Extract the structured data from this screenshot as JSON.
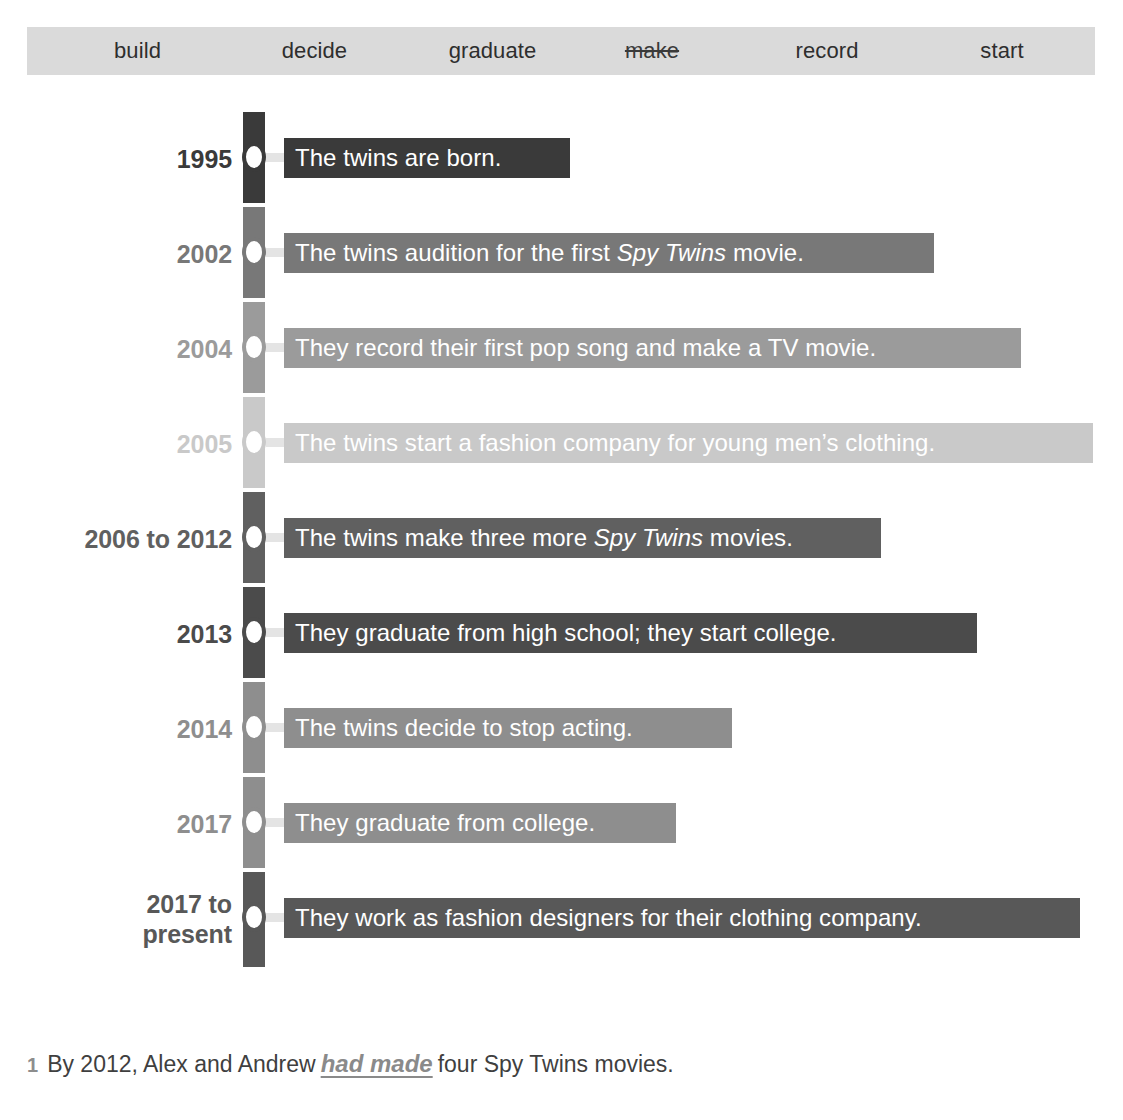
{
  "word_bank": {
    "name": "word-bank",
    "background_color": "#dadada",
    "words": [
      {
        "label": "build",
        "struck": false
      },
      {
        "label": "decide",
        "struck": false
      },
      {
        "label": "graduate",
        "struck": false
      },
      {
        "label": "make",
        "struck": true
      },
      {
        "label": "record",
        "struck": false
      },
      {
        "label": "start",
        "struck": false
      }
    ]
  },
  "timeline": {
    "rows": [
      {
        "year": "1995",
        "color": "#3a3a3a",
        "text_html": "The twins are born.",
        "bar_width": 286
      },
      {
        "year": "2002",
        "color": "#787878",
        "text_html": "The twins audition for the first <i>Spy Twins</i> movie.",
        "bar_width": 650
      },
      {
        "year": "2004",
        "color": "#9b9b9b",
        "text_html": "They record their first pop song and make a TV movie.",
        "bar_width": 737
      },
      {
        "year": "2005",
        "color": "#c9c9c9",
        "text_html": "The twins start a fashion company for young men’s clothing.",
        "bar_width": 809
      },
      {
        "year": "2006 to 2012",
        "color": "#606060",
        "text_html": "The twins make three more <i>Spy Twins</i> movies.",
        "bar_width": 597
      },
      {
        "year": "2013",
        "color": "#4b4b4b",
        "text_html": "They graduate from high school; they start college.",
        "bar_width": 693
      },
      {
        "year": "2014",
        "color": "#8e8e8e",
        "text_html": "The twins decide to stop acting.",
        "bar_width": 448
      },
      {
        "year": "2017",
        "color": "#8e8e8e",
        "text_html": "They graduate from college.",
        "bar_width": 392
      },
      {
        "year": "2017 to\npresent",
        "color": "#585858",
        "text_html": "They work as fashion designers for their clothing company.",
        "bar_width": 796
      }
    ]
  },
  "question": {
    "number": "1",
    "before": "By 2012, Alex and Andrew",
    "answer": "had made",
    "after": "four Spy Twins movies."
  }
}
